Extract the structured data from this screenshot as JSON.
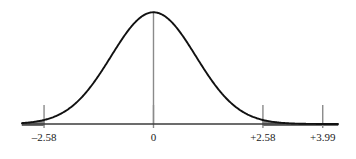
{
  "figure": {
    "name": "standard-normal-curve-with-critical-regions",
    "background_color": "#ffffff",
    "curve_color": "#111111",
    "axis_color": "#3b3b3b",
    "tick_color": "#8a8a8a",
    "center_line_color": "#8a8a8a",
    "shade_color": "#8c8c8c",
    "shade_edge_color": "#555555",
    "label_color": "#1a1a1a"
  },
  "chart_data": {
    "type": "line",
    "title": "",
    "subtitle": "",
    "xlabel": "",
    "ylabel": "",
    "distribution": "standard normal",
    "mean": 0,
    "sd": 1,
    "grid": false,
    "legend": null,
    "xlim": [
      -3.1,
      4.35
    ],
    "ylim": [
      0,
      0.4
    ],
    "tick_values": [
      -2.58,
      0,
      2.58,
      3.99
    ],
    "tick_labels": [
      "–2.58",
      "0",
      "+2.58",
      "+3.99"
    ],
    "annotations": [],
    "center_line": {
      "x": 0,
      "from_y": 0,
      "to_y": 0.4
    },
    "shaded_regions": [
      {
        "name": "left-tail",
        "from": -3.1,
        "to": -2.58,
        "label": "–2.58"
      },
      {
        "name": "right-tail",
        "from": 2.58,
        "to": 4.35,
        "label": "+2.58"
      }
    ],
    "x": [
      -3.1,
      -2.9,
      -2.7,
      -2.58,
      -2.4,
      -2.2,
      -2.0,
      -1.8,
      -1.6,
      -1.4,
      -1.2,
      -1.0,
      -0.8,
      -0.6,
      -0.4,
      -0.2,
      0,
      0.2,
      0.4,
      0.6,
      0.8,
      1.0,
      1.2,
      1.4,
      1.6,
      1.8,
      2.0,
      2.2,
      2.4,
      2.58,
      2.7,
      2.9,
      3.1,
      3.4,
      3.7,
      3.99,
      4.35
    ],
    "y": [
      0.0033,
      0.006,
      0.0104,
      0.0143,
      0.0224,
      0.0355,
      0.054,
      0.079,
      0.1109,
      0.1497,
      0.1942,
      0.242,
      0.2897,
      0.3332,
      0.3683,
      0.391,
      0.3989,
      0.391,
      0.3683,
      0.3332,
      0.2897,
      0.242,
      0.1942,
      0.1497,
      0.1109,
      0.079,
      0.054,
      0.0355,
      0.0224,
      0.0143,
      0.0104,
      0.006,
      0.0033,
      0.0012,
      0.0004,
      0.0001,
      0.0
    ]
  },
  "labels": {
    "left_critical": "–2.58",
    "center": "0",
    "right_critical": "+2.58",
    "observed": "+3.99"
  }
}
